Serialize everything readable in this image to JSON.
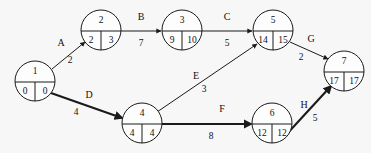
{
  "diagram": {
    "type": "activity-on-arrow-network",
    "title": "",
    "background_color": "#f7f7f7",
    "line_color": "#1a1a1a",
    "nodes": [
      {
        "id": "1",
        "label": "1",
        "early": "0",
        "late": "0",
        "cx": 35,
        "cy": 81,
        "r": 20
      },
      {
        "id": "2",
        "label": "2",
        "early": "2",
        "late": "3",
        "cx": 101,
        "cy": 30,
        "r": 20
      },
      {
        "id": "3",
        "label": "3",
        "early": "9",
        "late": "10",
        "cx": 182,
        "cy": 30,
        "r": 20
      },
      {
        "id": "5",
        "label": "5",
        "early": "14",
        "late": "15",
        "cx": 273,
        "cy": 30,
        "r": 20
      },
      {
        "id": "7",
        "label": "7",
        "early": "17",
        "late": "17",
        "cx": 344,
        "cy": 71,
        "r": 20
      },
      {
        "id": "4",
        "label": "4",
        "early": "4",
        "late": "4",
        "cx": 142,
        "cy": 123,
        "r": 20
      },
      {
        "id": "6",
        "label": "6",
        "early": "12",
        "late": "12",
        "cx": 272,
        "cy": 123,
        "r": 20
      }
    ],
    "edges": [
      {
        "id": "A",
        "label": "A",
        "duration": "2",
        "from": "1",
        "to": "2",
        "critical": false,
        "x1": 52,
        "y1": 69,
        "x2": 85,
        "y2": 42,
        "label_x": 61,
        "label_y": 44,
        "dur_x": 70,
        "dur_y": 61
      },
      {
        "id": "B",
        "label": "B",
        "duration": "7",
        "from": "2",
        "to": "3",
        "critical": false,
        "x1": 121,
        "y1": 31,
        "x2": 161,
        "y2": 31,
        "label_x": 141,
        "label_y": 18,
        "dur_x": 141,
        "dur_y": 44
      },
      {
        "id": "C",
        "label": "C",
        "duration": "5",
        "from": "3",
        "to": "5",
        "critical": false,
        "x1": 202,
        "y1": 31,
        "x2": 252,
        "y2": 31,
        "label_x": 227,
        "label_y": 18,
        "dur_x": 227,
        "dur_y": 44
      },
      {
        "id": "G",
        "label": "G",
        "duration": "2",
        "from": "5",
        "to": "7",
        "critical": false,
        "x1": 290,
        "y1": 42,
        "x2": 328,
        "y2": 59,
        "label_x": 311,
        "label_y": 40,
        "dur_x": 301,
        "dur_y": 58
      },
      {
        "id": "D",
        "label": "D",
        "duration": "4",
        "from": "1",
        "to": "4",
        "critical": true,
        "x1": 51,
        "y1": 93,
        "x2": 122,
        "y2": 118,
        "label_x": 89,
        "label_y": 96,
        "dur_x": 76,
        "dur_y": 113
      },
      {
        "id": "E",
        "label": "E",
        "duration": "3",
        "from": "4",
        "to": "5",
        "critical": false,
        "x1": 157,
        "y1": 112,
        "x2": 257,
        "y2": 44,
        "label_x": 196,
        "label_y": 77,
        "dur_x": 204,
        "dur_y": 90
      },
      {
        "id": "F",
        "label": "F",
        "duration": "8",
        "from": "4",
        "to": "6",
        "critical": true,
        "x1": 162,
        "y1": 124,
        "x2": 251,
        "y2": 124,
        "label_x": 222,
        "label_y": 110,
        "dur_x": 211,
        "dur_y": 137
      },
      {
        "id": "H",
        "label": "H",
        "duration": "5",
        "from": "6",
        "to": "7",
        "critical": true,
        "x1": 285,
        "y1": 136,
        "x2": 331,
        "y2": 86,
        "label_x": 304,
        "label_y": 106,
        "dur_x": 315,
        "dur_y": 119
      }
    ]
  }
}
